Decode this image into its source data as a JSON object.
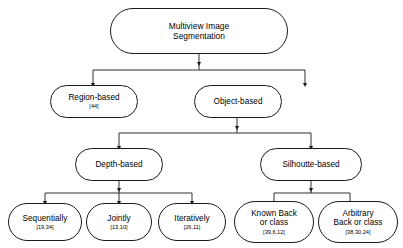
{
  "diagram": {
    "colors": {
      "node_border": "#1a1a1a",
      "node_fill": "#ffffff",
      "edge": "#1a1a1a",
      "text": "#000000",
      "background": "#ffffff"
    },
    "nodes": [
      {
        "id": "root",
        "label": "Multiview Image\nSegmentation",
        "ref": "",
        "level": 0
      },
      {
        "id": "region-based",
        "label": "Region-based",
        "ref": "[44]",
        "level": 1
      },
      {
        "id": "object-based",
        "label": "Object-based",
        "ref": "",
        "level": 1
      },
      {
        "id": "depth-based",
        "label": "Depth-based",
        "ref": "",
        "level": 2
      },
      {
        "id": "silhoutte-based",
        "label": "Silhoutte-based",
        "ref": "",
        "level": 2
      },
      {
        "id": "sequentially",
        "label": "Sequentially",
        "ref": "[19,34]",
        "level": 3
      },
      {
        "id": "jointly",
        "label": "Jointly",
        "ref": "[13,10]",
        "level": 3
      },
      {
        "id": "iteratively",
        "label": "Iteratively",
        "ref": "[26,11]",
        "level": 3
      },
      {
        "id": "known-back-or-class",
        "label": "Known Back\nor class",
        "ref": "[39,6,12]",
        "level": 3
      },
      {
        "id": "arbitrary-back-or-class",
        "label": "Arbitrary\nBack or class",
        "ref": "[38,30,24]",
        "level": 3
      }
    ],
    "edges": [
      {
        "from": "root",
        "to": "region-based"
      },
      {
        "from": "root",
        "to": "object-based"
      },
      {
        "from": "object-based",
        "to": "depth-based"
      },
      {
        "from": "object-based",
        "to": "silhoutte-based"
      },
      {
        "from": "depth-based",
        "to": "sequentially"
      },
      {
        "from": "depth-based",
        "to": "jointly"
      },
      {
        "from": "depth-based",
        "to": "iteratively"
      },
      {
        "from": "silhoutte-based",
        "to": "known-back-or-class"
      },
      {
        "from": "silhoutte-based",
        "to": "arbitrary-back-or-class"
      }
    ]
  }
}
